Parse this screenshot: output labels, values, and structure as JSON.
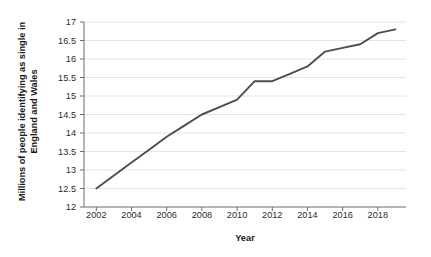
{
  "chart_data": {
    "type": "line",
    "title": "",
    "xlabel": "Year",
    "ylabel_line1": "Millions of people identifying as single in",
    "ylabel_line2": "England and Wales",
    "ylabel": "Millions of people identifying as single in England and Wales",
    "xlim": [
      2001.3,
      2019.6
    ],
    "ylim": [
      12,
      17
    ],
    "xticks": [
      2002,
      2004,
      2006,
      2008,
      2010,
      2012,
      2014,
      2016,
      2018
    ],
    "xtick_labels": [
      "2002",
      "2004",
      "2006",
      "2008",
      "2010",
      "2012",
      "2014",
      "2016",
      "2018"
    ],
    "yticks": [
      12,
      12.5,
      13,
      13.5,
      14,
      14.5,
      15,
      15.5,
      16,
      16.5,
      17
    ],
    "ytick_labels": [
      "12",
      "12.5",
      "13",
      "13.5",
      "14",
      "14.5",
      "15",
      "15.5",
      "16",
      "16.5",
      "17"
    ],
    "grid": "horizontal",
    "legend": "none",
    "line_color": "#4d4d4d",
    "grid_color": "#e4e4e4",
    "axis_color": "#6b6b6b",
    "x": [
      2002,
      2003,
      2004,
      2005,
      2006,
      2007,
      2008,
      2009,
      2010,
      2011,
      2012,
      2013,
      2014,
      2015,
      2016,
      2017,
      2018,
      2019
    ],
    "values": [
      12.5,
      12.85,
      13.2,
      13.55,
      13.9,
      14.2,
      14.5,
      14.7,
      14.9,
      15.4,
      15.4,
      15.6,
      15.8,
      16.2,
      16.3,
      16.4,
      16.7,
      16.8
    ],
    "series": [
      {
        "name": "Single people",
        "values": [
          12.5,
          12.85,
          13.2,
          13.55,
          13.9,
          14.2,
          14.5,
          14.7,
          14.9,
          15.4,
          15.4,
          15.6,
          15.8,
          16.2,
          16.3,
          16.4,
          16.7,
          16.8
        ]
      }
    ]
  }
}
